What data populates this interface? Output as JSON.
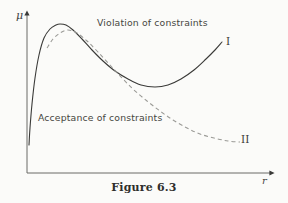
{
  "figure": {
    "caption": "Figure 6.3",
    "background_color": "#fbfbf9",
    "ink_color": "#3a3a38"
  },
  "axes": {
    "y_label": "μ",
    "x_label": "r",
    "y_axis_x": 27,
    "x_axis_y": 173,
    "x_axis_end": 275,
    "y_axis_top": 12,
    "arrowheads": true,
    "ticks": false,
    "grid": false
  },
  "regions": [
    {
      "id": "violation",
      "label": "Violation of constraints"
    },
    {
      "id": "acceptance",
      "label": "Acceptance of constraints"
    }
  ],
  "curve_labels": [
    {
      "id": "curve-i",
      "label": "I"
    },
    {
      "id": "curve-ii",
      "label": "II"
    }
  ],
  "chart_data": {
    "type": "line",
    "title": "Figure 6.3",
    "xlabel": "r",
    "ylabel": "μ",
    "grid": false,
    "legend": "inline-end-labels",
    "axis_style": "arrow-axes-no-ticks",
    "series": [
      {
        "name": "I",
        "style": "solid",
        "color": "#3a3a38",
        "end_label": "I",
        "points": [
          [
            29,
            145
          ],
          [
            30,
            128
          ],
          [
            32,
            104
          ],
          [
            35,
            78
          ],
          [
            39,
            55
          ],
          [
            44,
            38
          ],
          [
            50,
            29
          ],
          [
            56,
            25
          ],
          [
            60,
            24
          ],
          [
            66,
            25
          ],
          [
            73,
            30
          ],
          [
            82,
            39
          ],
          [
            92,
            50
          ],
          [
            103,
            61
          ],
          [
            115,
            71
          ],
          [
            128,
            79
          ],
          [
            141,
            85
          ],
          [
            155,
            87
          ],
          [
            168,
            85
          ],
          [
            181,
            79
          ],
          [
            194,
            70
          ],
          [
            206,
            59
          ],
          [
            215,
            50
          ],
          [
            222,
            42
          ]
        ]
      },
      {
        "name": "II",
        "style": "dashed",
        "color": "#9a9a96",
        "end_label": "II",
        "dash_pattern": "4 3",
        "points": [
          [
            47,
            48
          ],
          [
            53,
            39
          ],
          [
            60,
            33
          ],
          [
            68,
            30
          ],
          [
            77,
            33
          ],
          [
            87,
            41
          ],
          [
            98,
            52
          ],
          [
            110,
            65
          ],
          [
            122,
            78
          ],
          [
            134,
            90
          ],
          [
            147,
            101
          ],
          [
            160,
            111
          ],
          [
            173,
            120
          ],
          [
            187,
            128
          ],
          [
            200,
            134
          ],
          [
            214,
            138
          ],
          [
            228,
            141
          ],
          [
            240,
            142
          ]
        ]
      }
    ]
  }
}
